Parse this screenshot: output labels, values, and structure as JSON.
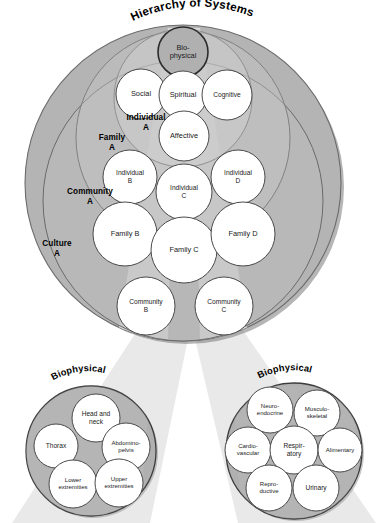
{
  "figure": {
    "title": "Hierarchy of Systems",
    "type": "nested-systems-diagram",
    "background_color": "#ffffff"
  },
  "colors": {
    "ring_culture": "#b4b4b4",
    "ring_community": "#bdbdbd",
    "ring_family": "#c6c6c6",
    "ring_individual": "#d2d2d2",
    "node_fill": "#ffffff",
    "node_stroke": "#4a4a4a",
    "biophysical_fill": "#b0b0b0",
    "biophysical_stroke": "#2b2b2b",
    "beam_light": "#e6e6e6",
    "beam_inner": "#a8a8a8",
    "outer_shadow": "#6f6f6f",
    "detail_ring_fill": "#b0b0b0",
    "text": "#1a1a1a"
  },
  "main_circle": {
    "ring_labels": [
      {
        "id": "culture-a",
        "line1": "Culture",
        "line2": "A",
        "x": 57,
        "y": 244
      },
      {
        "id": "community-a",
        "line1": "Community",
        "line2": "A",
        "x": 90,
        "y": 192
      },
      {
        "id": "family-a",
        "line1": "Family",
        "line2": "A",
        "x": 112,
        "y": 138
      },
      {
        "id": "individual-a",
        "line1": "Individual",
        "line2": "A",
        "x": 146,
        "y": 118
      }
    ],
    "nodes": [
      {
        "id": "biophysical",
        "lines": [
          "Bio-",
          "physical"
        ],
        "cx": 183,
        "cy": 52,
        "r": 25,
        "highlight": true,
        "size": "normal"
      },
      {
        "id": "social",
        "lines": [
          "Social"
        ],
        "cx": 141,
        "cy": 94,
        "r": 25,
        "highlight": false,
        "size": "normal"
      },
      {
        "id": "spiritual",
        "lines": [
          "Spiritual"
        ],
        "cx": 183,
        "cy": 95,
        "r": 24,
        "highlight": false,
        "size": "normal"
      },
      {
        "id": "cognitive",
        "lines": [
          "Cognitive"
        ],
        "cx": 227,
        "cy": 95,
        "r": 25,
        "highlight": false,
        "size": "small"
      },
      {
        "id": "affective",
        "lines": [
          "Affective"
        ],
        "cx": 184,
        "cy": 136,
        "r": 25,
        "highlight": false,
        "size": "normal"
      },
      {
        "id": "individual-b",
        "lines": [
          "Individual",
          "B"
        ],
        "cx": 130,
        "cy": 177,
        "r": 27,
        "highlight": false,
        "size": "small"
      },
      {
        "id": "individual-c",
        "lines": [
          "Individual",
          "C"
        ],
        "cx": 184,
        "cy": 192,
        "r": 28,
        "highlight": false,
        "size": "small"
      },
      {
        "id": "individual-d",
        "lines": [
          "Individual",
          "D"
        ],
        "cx": 238,
        "cy": 177,
        "r": 27,
        "highlight": false,
        "size": "small"
      },
      {
        "id": "family-b",
        "lines": [
          "Family B"
        ],
        "cx": 125,
        "cy": 234,
        "r": 32,
        "highlight": false,
        "size": "normal"
      },
      {
        "id": "family-c",
        "lines": [
          "Family C"
        ],
        "cx": 184,
        "cy": 250,
        "r": 33,
        "highlight": false,
        "size": "normal"
      },
      {
        "id": "family-d",
        "lines": [
          "Family D"
        ],
        "cx": 243,
        "cy": 234,
        "r": 32,
        "highlight": false,
        "size": "normal"
      },
      {
        "id": "community-b",
        "lines": [
          "Community",
          "B"
        ],
        "cx": 146,
        "cy": 306,
        "r": 29,
        "highlight": false,
        "size": "small"
      },
      {
        "id": "community-c",
        "lines": [
          "Community",
          "C"
        ],
        "cx": 224,
        "cy": 306,
        "r": 29,
        "highlight": false,
        "size": "small"
      }
    ]
  },
  "detail_left": {
    "title": "Biophysical",
    "nodes": [
      {
        "id": "thorax",
        "lines": [
          "Thorax"
        ],
        "cx": 56,
        "cy": 446,
        "r": 22,
        "size": "small"
      },
      {
        "id": "head-and-neck",
        "lines": [
          "Head and",
          "neck"
        ],
        "cx": 96,
        "cy": 418,
        "r": 24,
        "size": "small"
      },
      {
        "id": "abdomino-pelvis",
        "lines": [
          "Abdomino-",
          "pelvis"
        ],
        "cx": 126,
        "cy": 447,
        "r": 24,
        "size": "tiny"
      },
      {
        "id": "lower-extremities",
        "lines": [
          "Lower",
          "extremities"
        ],
        "cx": 73,
        "cy": 484,
        "r": 24,
        "size": "tiny"
      },
      {
        "id": "upper-extremities",
        "lines": [
          "Upper",
          "extremities"
        ],
        "cx": 119,
        "cy": 483,
        "r": 24,
        "size": "tiny"
      }
    ]
  },
  "detail_right": {
    "title": "Biophysical",
    "nodes": [
      {
        "id": "neuro-endocrine",
        "lines": [
          "Neuro-",
          "endocrine"
        ],
        "cx": 270,
        "cy": 410,
        "r": 23,
        "size": "tiny"
      },
      {
        "id": "musculo-skeletal",
        "lines": [
          "Musculo-",
          "skeletal"
        ],
        "cx": 317,
        "cy": 413,
        "r": 23,
        "size": "tiny"
      },
      {
        "id": "cardio-vascular",
        "lines": [
          "Cardio-",
          "vascular"
        ],
        "cx": 248,
        "cy": 450,
        "r": 23,
        "size": "tiny"
      },
      {
        "id": "respiratory",
        "lines": [
          "Respir-",
          "atory"
        ],
        "cx": 294,
        "cy": 450,
        "r": 24,
        "size": "small"
      },
      {
        "id": "alimentary",
        "lines": [
          "Alimentary"
        ],
        "cx": 340,
        "cy": 450,
        "r": 22,
        "size": "tiny"
      },
      {
        "id": "reproductive",
        "lines": [
          "Repro-",
          "ductive"
        ],
        "cx": 269,
        "cy": 488,
        "r": 23,
        "size": "tiny"
      },
      {
        "id": "urinary",
        "lines": [
          "Urinary"
        ],
        "cx": 316,
        "cy": 488,
        "r": 23,
        "size": "small"
      }
    ]
  }
}
